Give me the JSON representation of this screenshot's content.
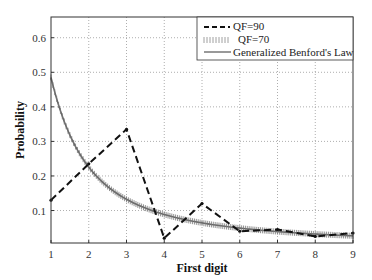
{
  "chart_data": {
    "type": "line",
    "title": "",
    "xlabel": "First digit",
    "ylabel": "Probability",
    "x": [
      1,
      2,
      3,
      4,
      5,
      6,
      7,
      8,
      9
    ],
    "xlim": [
      1,
      9
    ],
    "ylim": [
      0.006,
      0.66
    ],
    "xticks": [
      "1",
      "2",
      "3",
      "4",
      "5",
      "6",
      "7",
      "8",
      "9"
    ],
    "yticks": [
      "0.1",
      "0.2",
      "0.3",
      "0.4",
      "0.5",
      "0.6"
    ],
    "grid": true,
    "legend_position": "upper right",
    "series": [
      {
        "name": "QF=90",
        "style": "dashed",
        "values": [
          0.13,
          0.235,
          0.335,
          0.02,
          0.12,
          0.04,
          0.045,
          0.025,
          0.035
        ]
      },
      {
        "name": "QF=70",
        "style": "dotted-markers",
        "values": [
          0.63,
          0.18,
          0.1,
          0.065,
          0.05,
          0.038,
          0.03,
          0.022,
          0.018
        ]
      },
      {
        "name": "Generalized Benford's Law",
        "style": "solid",
        "values": [
          0.63,
          0.18,
          0.1,
          0.065,
          0.05,
          0.038,
          0.03,
          0.022,
          0.018
        ]
      }
    ]
  }
}
